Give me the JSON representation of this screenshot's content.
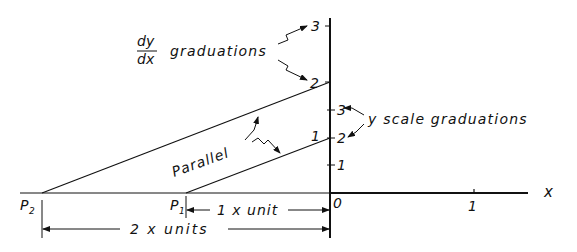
{
  "labels": {
    "dydx_num": "dy",
    "dydx_den": "dx",
    "dydx_graduations": "graduations",
    "y_scale_graduations": "y scale graduations",
    "parallel": "Parallel",
    "p2": "P",
    "p2_sub": "2",
    "p1": "P",
    "p1_sub": "1",
    "one_x_unit": "1 x unit",
    "two_x_units": "2 x units",
    "x_axis": "x",
    "origin": "0",
    "x_tick_1": "1"
  },
  "dydx_ticks": [
    "1",
    "2",
    "3"
  ],
  "y_ticks": [
    "1",
    "2",
    "3"
  ]
}
